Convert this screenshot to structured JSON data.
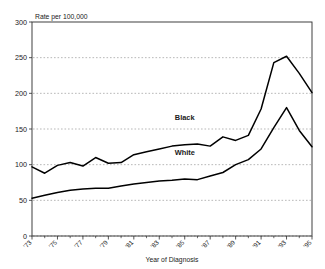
{
  "chart_data": {
    "type": "line",
    "title": "",
    "unit_label": "Rate per 100,000",
    "xlabel": "Year of Diagnosis",
    "ylabel": "",
    "xlim": [
      1973,
      1995
    ],
    "ylim": [
      0,
      300
    ],
    "y_ticks": [
      0,
      50,
      100,
      150,
      200,
      250,
      300
    ],
    "y_tick_labels": [
      "0",
      "50",
      "100",
      "150",
      "200",
      "250",
      "300"
    ],
    "grid": "horizontal-dashed",
    "legend_position": "inline-annotation",
    "x": [
      1973,
      1974,
      1975,
      1976,
      1977,
      1978,
      1979,
      1980,
      1981,
      1982,
      1983,
      1984,
      1985,
      1986,
      1987,
      1988,
      1989,
      1990,
      1991,
      1992,
      1993,
      1994,
      1995
    ],
    "x_tick_labels": [
      "'73",
      "'74",
      "'75",
      "'76",
      "'77",
      "'78",
      "'79",
      "'80",
      "'81",
      "'82",
      "'83",
      "'84",
      "'85",
      "'86",
      "'87",
      "'88",
      "'89",
      "'90",
      "'91",
      "'92",
      "'93",
      "'94",
      "'95"
    ],
    "x_labeled_ticks": [
      "'73",
      "'75",
      "'77",
      "'79",
      "'81",
      "'83",
      "'85",
      "'87",
      "'89",
      "'91",
      "'93",
      "'95"
    ],
    "series": [
      {
        "name": "Black",
        "color": "#000000",
        "label_x": 1985,
        "label_y": 163,
        "values": [
          97,
          88,
          99,
          103,
          98,
          110,
          102,
          103,
          114,
          118,
          122,
          126,
          128,
          129,
          126,
          139,
          134,
          141,
          178,
          243,
          252,
          228,
          201
        ]
      },
      {
        "name": "White",
        "color": "#000000",
        "label_x": 1985,
        "label_y": 114,
        "values": [
          53,
          57,
          61,
          64,
          66,
          67,
          67,
          70,
          73,
          75,
          77,
          78,
          80,
          79,
          84,
          89,
          100,
          107,
          122,
          152,
          180,
          148,
          125
        ]
      }
    ]
  }
}
